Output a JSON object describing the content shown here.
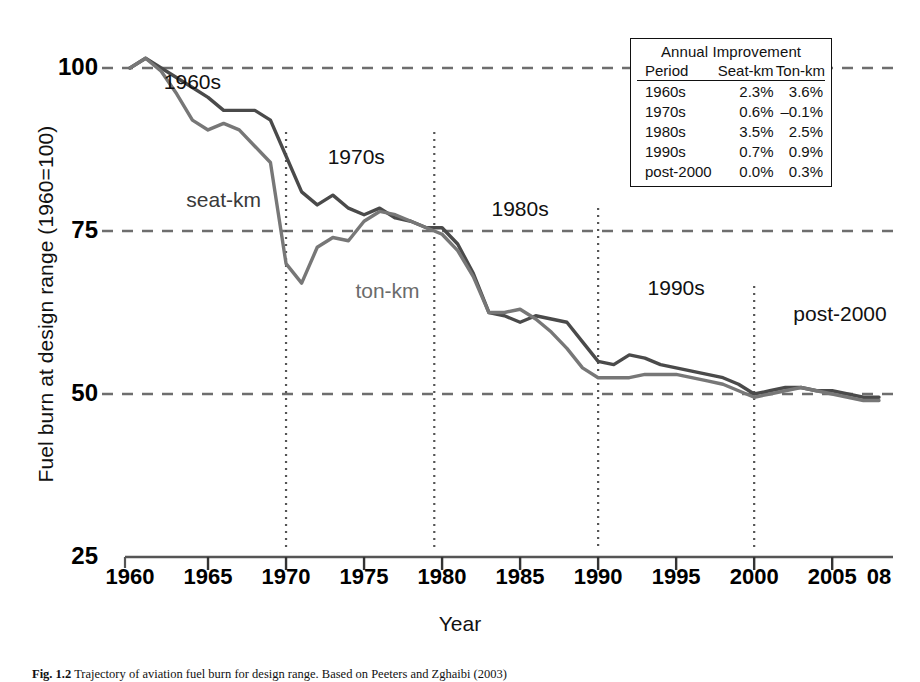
{
  "chart_data": {
    "type": "line",
    "title": "",
    "xlabel": "Year",
    "ylabel": "Fuel burn at design range (1960=100)",
    "xlim": [
      1960,
      2008
    ],
    "ylim": [
      25,
      102
    ],
    "yticks": [
      100,
      75,
      50,
      25
    ],
    "xticks": [
      1960,
      1965,
      1970,
      1975,
      1980,
      1985,
      1990,
      1995,
      2000,
      2005,
      2008
    ],
    "xtick_labels": [
      "1960",
      "1965",
      "1970",
      "1975",
      "1980",
      "1985",
      "1990",
      "1995",
      "2000",
      "2005",
      "08"
    ],
    "grid": "dashed horizontal gridlines at 100, 75 and 50",
    "legend_position": "inline labels on curves",
    "x": [
      1960,
      1961,
      1962,
      1963,
      1964,
      1965,
      1966,
      1967,
      1968,
      1969,
      1970,
      1971,
      1972,
      1973,
      1974,
      1975,
      1976,
      1977,
      1978,
      1979,
      1980,
      1981,
      1982,
      1983,
      1984,
      1985,
      1986,
      1987,
      1988,
      1989,
      1990,
      1991,
      1992,
      1993,
      1994,
      1995,
      1996,
      1997,
      1998,
      1999,
      2000,
      2001,
      2002,
      2003,
      2004,
      2005,
      2006,
      2007,
      2008
    ],
    "series": [
      {
        "name": "seat-km",
        "color": "#4a4a4a",
        "values": [
          100,
          101.5,
          100,
          98.5,
          97,
          95.5,
          93.5,
          93.5,
          93.5,
          92,
          86.5,
          81,
          79,
          80.5,
          78.5,
          77.5,
          78.5,
          77,
          76.5,
          75.5,
          75.5,
          73,
          68.5,
          62.5,
          62,
          61,
          62,
          61.5,
          61,
          58,
          55,
          54.5,
          56,
          55.5,
          54.5,
          54,
          53.5,
          53,
          52.5,
          51.5,
          50,
          50.5,
          51,
          51,
          50.5,
          50.5,
          50,
          49.5,
          49.5
        ]
      },
      {
        "name": "ton-km",
        "color": "#777777",
        "values": [
          100,
          101.5,
          99.5,
          96,
          92,
          90.5,
          91.5,
          90.5,
          88,
          85.5,
          70,
          67,
          72.5,
          74,
          73.5,
          76.5,
          78,
          77.5,
          76.5,
          75.5,
          74.5,
          72,
          68,
          62.5,
          62.5,
          63,
          61.5,
          59.5,
          57,
          54,
          52.5,
          52.5,
          52.5,
          53,
          53,
          53,
          52.5,
          52,
          51.5,
          50.5,
          49.5,
          50,
          50.5,
          51,
          50.5,
          50,
          49.5,
          49,
          49
        ]
      }
    ],
    "period_labels": [
      {
        "text": "1960s",
        "year": 1964.0,
        "y": 97.5
      },
      {
        "text": "1970s",
        "year": 1974.5,
        "y": 86.0
      },
      {
        "text": "1980s",
        "year": 1985.0,
        "y": 78.0
      },
      {
        "text": "1990s",
        "year": 1995.0,
        "y": 66.0
      },
      {
        "text": "post-2000",
        "year": 2005.5,
        "y": 62.0
      }
    ],
    "series_labels": [
      {
        "text": "seat-km",
        "year": 1966.0,
        "y": 79.5
      },
      {
        "text": "ton-km",
        "year": 1976.5,
        "y": 65.5
      }
    ],
    "period_dividers": [
      1970,
      1979.5,
      1990,
      2000
    ]
  },
  "legend": {
    "title": "Annual Improvement",
    "columns": [
      "Period",
      "Seat-km",
      "Ton-km"
    ],
    "rows": [
      {
        "period": "1960s",
        "seat_km": "2.3%",
        "ton_km": "3.6%"
      },
      {
        "period": "1970s",
        "seat_km": "0.6%",
        "ton_km": "–0.1%"
      },
      {
        "period": "1980s",
        "seat_km": "3.5%",
        "ton_km": "2.5%"
      },
      {
        "period": "1990s",
        "seat_km": "0.7%",
        "ton_km": "0.9%"
      },
      {
        "period": "post-2000",
        "seat_km": "0.0%",
        "ton_km": "0.3%"
      }
    ]
  },
  "caption": {
    "figure_number": "Fig. 1.2",
    "text": "Trajectory of aviation fuel burn for design range. Based on Peeters and Zghaibi (2003)"
  }
}
